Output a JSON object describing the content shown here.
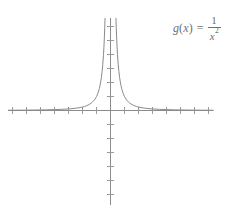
{
  "figure": {
    "background_color": "#ffffff",
    "width": 241,
    "height": 214
  },
  "label": {
    "function_name": "g",
    "open_paren": "(",
    "variable": "x",
    "close_paren": ")",
    "equals": "=",
    "numerator": "1",
    "denominator_base": "x",
    "denominator_exponent": "2",
    "full_text": "g(x) = 1/x^2",
    "color": "#6f6f6f"
  },
  "chart_data": {
    "type": "line",
    "title": "",
    "subtitle": "",
    "xlabel": "",
    "ylabel": "",
    "annotations": [
      {
        "text": "g(x) = 1/x^2",
        "position": "top-right"
      }
    ],
    "legend": {
      "entries": [],
      "position": "none"
    },
    "grid": false,
    "axes": {
      "x_axis_visible": true,
      "y_axis_visible": true,
      "axis_color": "#8c8c8c",
      "tick_color": "#9a9a9a",
      "tick_labels_shown": false,
      "x_tick_spacing_units": 1,
      "y_tick_spacing_units": 1,
      "origin_px": [
        110,
        110
      ],
      "x_axis_span_px": [
        8,
        213
      ],
      "y_axis_span_px": [
        18,
        205
      ],
      "pixels_per_unit_x": 14,
      "pixels_per_unit_y": 14
    },
    "xlim": [
      -7.3,
      7.4
    ],
    "ylim": [
      -6.8,
      6.6
    ],
    "x_ticks": [
      -7,
      -6,
      -5,
      -4,
      -3,
      -2,
      -1,
      1,
      2,
      3,
      4,
      5,
      6,
      7
    ],
    "y_ticks": [
      -6,
      -5,
      -4,
      -3,
      -2,
      -1,
      1,
      2,
      3,
      4,
      5,
      6
    ],
    "series": [
      {
        "name": "g(x) = 1/x^2",
        "expression": "1/x^2",
        "color": "#8a8a8a",
        "linewidth": 1,
        "branch": "left",
        "x": [
          -7.3,
          -7.0,
          -6.5,
          -6.0,
          -5.5,
          -5.0,
          -4.5,
          -4.0,
          -3.5,
          -3.0,
          -2.75,
          -2.5,
          -2.25,
          -2.0,
          -1.85,
          -1.7,
          -1.55,
          -1.4,
          -1.3,
          -1.2,
          -1.1,
          -1.0,
          -0.95,
          -0.9,
          -0.85,
          -0.8,
          -0.75,
          -0.7,
          -0.65,
          -0.6,
          -0.55,
          -0.5,
          -0.47,
          -0.44,
          -0.41,
          -0.39
        ],
        "y": [
          0.019,
          0.02,
          0.024,
          0.028,
          0.033,
          0.04,
          0.049,
          0.063,
          0.082,
          0.111,
          0.132,
          0.16,
          0.198,
          0.25,
          0.292,
          0.346,
          0.416,
          0.51,
          0.592,
          0.694,
          0.826,
          1.0,
          1.108,
          1.235,
          1.384,
          1.563,
          1.778,
          2.041,
          2.367,
          2.778,
          3.306,
          4.0,
          4.527,
          5.165,
          5.949,
          6.575
        ]
      },
      {
        "name": "g(x) = 1/x^2",
        "expression": "1/x^2",
        "color": "#8a8a8a",
        "linewidth": 1,
        "branch": "right",
        "x": [
          0.39,
          0.41,
          0.44,
          0.47,
          0.5,
          0.55,
          0.6,
          0.65,
          0.7,
          0.75,
          0.8,
          0.85,
          0.9,
          0.95,
          1.0,
          1.1,
          1.2,
          1.3,
          1.4,
          1.55,
          1.7,
          1.85,
          2.0,
          2.25,
          2.5,
          2.75,
          3.0,
          3.5,
          4.0,
          4.5,
          5.0,
          5.5,
          6.0,
          6.5,
          7.0,
          7.35
        ],
        "y": [
          6.575,
          5.949,
          5.165,
          4.527,
          4.0,
          3.306,
          2.778,
          2.367,
          2.041,
          1.778,
          1.563,
          1.384,
          1.235,
          1.108,
          1.0,
          0.826,
          0.694,
          0.592,
          0.51,
          0.416,
          0.346,
          0.292,
          0.25,
          0.198,
          0.16,
          0.132,
          0.111,
          0.082,
          0.063,
          0.049,
          0.04,
          0.033,
          0.028,
          0.024,
          0.02,
          0.019
        ]
      }
    ],
    "asymptotes": {
      "vertical": [
        0
      ],
      "horizontal": [
        0
      ]
    }
  }
}
